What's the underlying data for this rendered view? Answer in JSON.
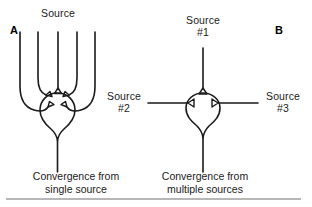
{
  "figure": {
    "background_color": "#ffffff",
    "ink_color": "#1a1a1a",
    "rule_color": "#707070"
  },
  "panels": [
    {
      "letter": "A",
      "source_label": "Source",
      "caption": "Convergence from\nsingle source",
      "description": "Convergence from single source",
      "dendrite_count": 5
    },
    {
      "letter": "B",
      "caption": "Convergence from\nmultiple sources",
      "description": "Convergence from multiple sources",
      "sources": [
        {
          "id": "source-1",
          "line1": "Source",
          "line2": "#1",
          "position": "top"
        },
        {
          "id": "source-2",
          "line1": "Source",
          "line2": "#2",
          "position": "left"
        },
        {
          "id": "source-3",
          "line1": "Source",
          "line2": "#3",
          "position": "right"
        }
      ]
    }
  ]
}
